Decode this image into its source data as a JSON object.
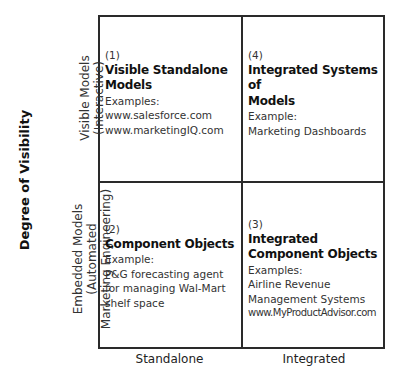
{
  "diagram": {
    "y_axis_title": "Degree of Visibility",
    "row_labels": [
      {
        "line1": "Visible Models",
        "line2": "(Interactive)"
      },
      {
        "line1": "Embedded Models",
        "line2": "(Automated",
        "line3": "Marketing Engineering)"
      }
    ],
    "column_labels": [
      "Standalone",
      "Integrated"
    ],
    "quadrants": [
      {
        "number": "(1)",
        "title_line1": "Visible Standalone",
        "title_line2": "Models",
        "examples_label": "Examples:",
        "items": [
          "www.salesforce.com",
          "www.marketingIQ.com"
        ]
      },
      {
        "number": "(4)",
        "title_line1": "Integrated Systems of",
        "title_line2": "Models",
        "examples_label": "Example:",
        "items": [
          "Marketing Dashboards"
        ]
      },
      {
        "number": "(2)",
        "title_line1": "Component Objects",
        "examples_label": "Example:",
        "items": [
          "P&G forecasting agent",
          "for managing Wal-Mart",
          "shelf space"
        ]
      },
      {
        "number": "(3)",
        "title_line1": "Integrated",
        "title_line2": "Component Objects",
        "examples_label": "Examples:",
        "items": [
          "Airline Revenue",
          "Management Systems",
          "www.MyProductAdvisor.com"
        ]
      }
    ]
  }
}
